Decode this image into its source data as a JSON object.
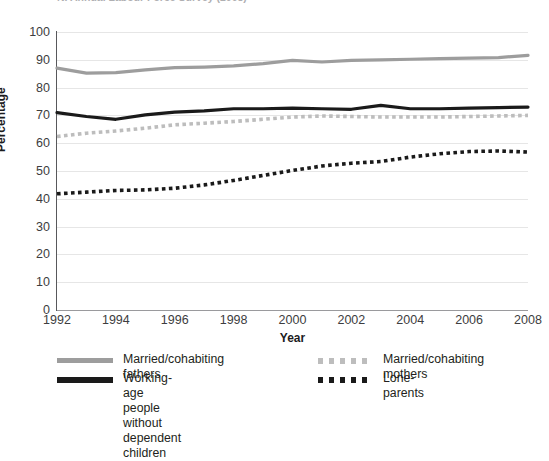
{
  "title": "NI Annual Labour Force Survey (2008)",
  "axes": {
    "y_label": "Percentage",
    "x_label": "Year",
    "y_ticks": [
      "0",
      "10",
      "20",
      "30",
      "40",
      "50",
      "60",
      "70",
      "80",
      "90",
      "100"
    ],
    "x_ticks": [
      "1992",
      "1994",
      "1996",
      "1998",
      "2000",
      "2002",
      "2004",
      "2006",
      "2008"
    ]
  },
  "colors": {
    "fathers": "#9d9d9d",
    "working_age": "#1a1a1a",
    "mothers": "#bdbdbd",
    "lone_parents": "#1a1a1a",
    "grid": "#e6e6e6",
    "axis": "#58585b"
  },
  "legend": {
    "items": [
      {
        "label": "Married/cohabiting fathers",
        "key": "solid-gray-line-key"
      },
      {
        "label": "Working-age people without\ndependent children",
        "key": "solid-black-line-key"
      },
      {
        "label": "Married/cohabiting mothers",
        "key": "dotted-gray-line-key"
      },
      {
        "label": "Lone-parents",
        "key": "dotted-black-line-key"
      }
    ]
  },
  "chart_data": {
    "type": "line",
    "title": "NI Annual Labour Force Survey (2008)",
    "xlabel": "Year",
    "ylabel": "Percentage",
    "xlim": [
      1992,
      2008
    ],
    "ylim": [
      0,
      100
    ],
    "grid": true,
    "legend_position": "bottom",
    "x": [
      1992,
      1993,
      1994,
      1995,
      1996,
      1997,
      1998,
      1999,
      2000,
      2001,
      2002,
      2003,
      2004,
      2005,
      2006,
      2007,
      2008
    ],
    "series": [
      {
        "name": "Married/cohabiting fathers",
        "style": "solid",
        "color": "#9d9d9d",
        "values": [
          87.0,
          85.2,
          85.4,
          86.4,
          87.2,
          87.4,
          87.8,
          88.6,
          89.8,
          89.2,
          89.8,
          90.0,
          90.2,
          90.4,
          90.6,
          90.8,
          91.6
        ]
      },
      {
        "name": "Working-age people without dependent children",
        "style": "solid",
        "color": "#1a1a1a",
        "values": [
          71.0,
          69.6,
          68.6,
          70.2,
          71.2,
          71.6,
          72.4,
          72.4,
          72.6,
          72.4,
          72.2,
          73.6,
          72.4,
          72.4,
          72.6,
          72.8,
          73.0
        ]
      },
      {
        "name": "Married/cohabiting mothers",
        "style": "dotted",
        "color": "#bdbdbd",
        "values": [
          62.4,
          63.6,
          64.4,
          65.4,
          66.6,
          67.2,
          67.8,
          68.6,
          69.4,
          69.8,
          69.6,
          69.4,
          69.4,
          69.4,
          69.6,
          69.8,
          70.0
        ]
      },
      {
        "name": "Lone-parents",
        "style": "dotted",
        "color": "#1a1a1a",
        "values": [
          41.8,
          42.4,
          43.0,
          43.2,
          43.8,
          45.0,
          46.6,
          48.4,
          50.2,
          51.8,
          52.8,
          53.4,
          55.0,
          56.2,
          57.0,
          57.2,
          56.8
        ]
      }
    ]
  }
}
